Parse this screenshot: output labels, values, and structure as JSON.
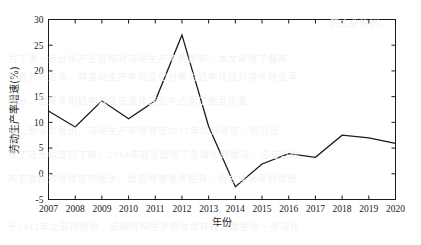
{
  "chart_data": {
    "type": "line",
    "title": "",
    "subtitle": "",
    "xlabel": "年份",
    "ylabel": "劳动生产率增速(%)",
    "categories": [
      "2007",
      "2008",
      "2009",
      "2010",
      "2011",
      "2012",
      "2013",
      "2014",
      "2015",
      "2016",
      "2017",
      "2018",
      "2019",
      "2020"
    ],
    "x": [
      2007,
      2008,
      2009,
      2010,
      2011,
      2012,
      2013,
      2014,
      2015,
      2016,
      2017,
      2018,
      2019,
      2020
    ],
    "values": [
      12.2,
      9.1,
      14.2,
      10.7,
      14.2,
      27.0,
      9.2,
      -2.5,
      1.9,
      3.9,
      3.2,
      7.5,
      7.0,
      5.9
    ],
    "series": [
      {
        "name": "劳动生产率增速",
        "values": [
          12.2,
          9.1,
          14.2,
          10.7,
          14.2,
          27.0,
          9.2,
          -2.5,
          1.9,
          3.9,
          3.2,
          7.5,
          7.0,
          5.9
        ]
      }
    ],
    "xlim": [
      2007,
      2020
    ],
    "ylim": [
      -5,
      30
    ],
    "ytick_labels": [
      "-5",
      "0",
      "5",
      "10",
      "15",
      "20",
      "25",
      "30"
    ],
    "yticks": [
      -5,
      0,
      5,
      10,
      15,
      20,
      25,
      30
    ],
    "xtick_labels": [
      "2007",
      "2008",
      "2009",
      "2010",
      "2011",
      "2012",
      "2013",
      "2014",
      "2015",
      "2016",
      "2017",
      "2018",
      "2019",
      "2020"
    ],
    "grid": false,
    "legend": null,
    "legend_position": "none",
    "line_color": "#1a1a1a",
    "line_width": 1.3,
    "markers": false,
    "axis_color": "#1a1a1a",
    "background_color": "#ffffff",
    "annotations": []
  },
  "axes": {
    "y_title": "劳动生产率增速(%)",
    "x_title": "年份"
  },
  "bleed_text": {
    "lines": [
      "的主要原因。",
      "为了进一步分析产业结构对劳动生产率的影响，本文采用了偏离",
      "份额分析方法，将劳动生产率的变化分解为结构效应与增长效应两",
      "部分，结果表明结构效应在总体变化中占据了相当比重。",
      "从上图可以看出，劳动生产率增速在2012年达到峰值，随后出",
      "现了较大幅度的下降，2014年甚至出现了负增长的情况，这与当时",
      "的宏观经济环境密切相关。此后增速逐步回升，但总体水平仍然低",
      "于2012年之前的阶段，说明结构性矛盾依然存在，需要进一步深化"
    ]
  }
}
